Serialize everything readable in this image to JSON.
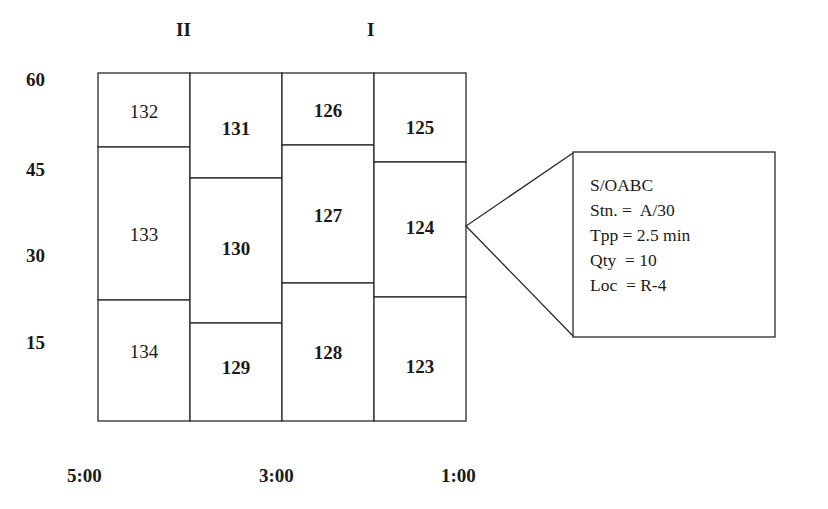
{
  "column_group_labels": [
    "II",
    "I"
  ],
  "y_axis_labels": [
    "60",
    "45",
    "30",
    "15"
  ],
  "x_axis_labels": [
    "5:00",
    "3:00",
    "1:00"
  ],
  "columns": [
    {
      "cells": [
        {
          "id": "132",
          "bold": false
        },
        {
          "id": "133",
          "bold": false
        },
        {
          "id": "134",
          "bold": false
        }
      ]
    },
    {
      "cells": [
        {
          "id": "131",
          "bold": true
        },
        {
          "id": "130",
          "bold": true
        },
        {
          "id": "129",
          "bold": true
        }
      ]
    },
    {
      "cells": [
        {
          "id": "126",
          "bold": true
        },
        {
          "id": "127",
          "bold": true
        },
        {
          "id": "128",
          "bold": true
        }
      ]
    },
    {
      "cells": [
        {
          "id": "125",
          "bold": true
        },
        {
          "id": "124",
          "bold": true
        },
        {
          "id": "123",
          "bold": true
        }
      ]
    }
  ],
  "callout": {
    "target_cell": "124",
    "lines": [
      "S/OABC",
      "Stn. =  A/30",
      "Tpp = 2.5 min",
      "Qty  = 10",
      "Loc  = R-4"
    ]
  }
}
